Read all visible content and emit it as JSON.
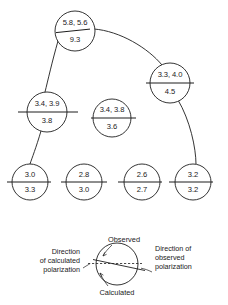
{
  "figure": {
    "type": "polarization-comparison-diagram",
    "nodes": [
      {
        "id": "n1",
        "observed": "5.8, 5.6",
        "calculated": "9.3",
        "cx": 75,
        "cy": 31,
        "r": 20,
        "divider_angle_deg": -2.5,
        "divider_extend_left": 18,
        "divider_extend_right": 14
      },
      {
        "id": "n2",
        "observed": "3.3, 4.0",
        "calculated": "4.5",
        "cx": 170,
        "cy": 83,
        "r": 20,
        "divider_angle_deg": 0,
        "divider_extend_left": 12,
        "divider_extend_right": 8
      },
      {
        "id": "n3",
        "observed": "3.4, 3.9",
        "calculated": "3.8",
        "cx": 47,
        "cy": 112,
        "r": 20,
        "divider_angle_deg": 0,
        "divider_extend_left": 24,
        "divider_extend_right": 24
      },
      {
        "id": "n4",
        "observed": "3.4, 3.8",
        "calculated": "3.6",
        "cx": 112,
        "cy": 118,
        "r": 19,
        "divider_angle_deg": 0,
        "divider_extend_left": 12,
        "divider_extend_right": 12
      },
      {
        "id": "n5",
        "observed": "3.0",
        "calculated": "3.3",
        "cx": 30,
        "cy": 182,
        "r": 18,
        "divider_angle_deg": 0,
        "divider_extend_left": 14,
        "divider_extend_right": 10
      },
      {
        "id": "n6",
        "observed": "2.8",
        "calculated": "3.0",
        "cx": 84,
        "cy": 182,
        "r": 18,
        "divider_angle_deg": 0,
        "divider_extend_left": 14,
        "divider_extend_right": 14
      },
      {
        "id": "n7",
        "observed": "2.6",
        "calculated": "2.7",
        "cx": 142,
        "cy": 182,
        "r": 18,
        "divider_angle_deg": 0,
        "divider_extend_left": 16,
        "divider_extend_right": 10
      },
      {
        "id": "n8",
        "observed": "3.2",
        "calculated": "3.2",
        "cx": 193,
        "cy": 182,
        "r": 18,
        "divider_angle_deg": 0,
        "divider_extend_left": 16,
        "divider_extend_right": 10
      }
    ],
    "connectors": [
      {
        "id": "c1",
        "from": "n1",
        "to": "n2",
        "path": "M 94 29 C 120 31 148 48 162 65"
      },
      {
        "id": "c2",
        "from": "n1",
        "to": "n3",
        "path": "M 58 41 C 52 62 48 80 45 92"
      },
      {
        "id": "c3",
        "from": "n3",
        "to": "n5",
        "path": "M 41 131 C 36 148 32 158 30 164"
      },
      {
        "id": "c4",
        "from": "n2",
        "to": "n8",
        "path": "M 178 100 C 190 120 196 148 196 164"
      }
    ]
  },
  "legend": {
    "observed_label": "Observed",
    "calculated_label": "Calculated",
    "left_label_lines": [
      "Direction",
      "of calculated",
      "polarization"
    ],
    "right_label_lines": [
      "Direction of",
      "observed",
      "polarization"
    ],
    "circle": {
      "cx": 117,
      "cy": 264,
      "r": 21
    }
  },
  "colors": {
    "ink": "#1d1d1d",
    "background": "#ffffff"
  }
}
